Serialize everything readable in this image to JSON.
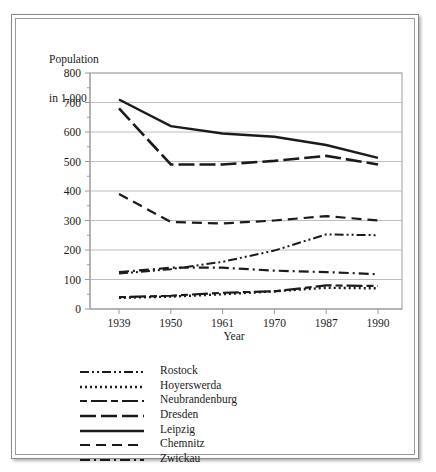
{
  "figure": {
    "axis_title_line1": "Population",
    "axis_title_line2": "in 1,000"
  },
  "chart_data": {
    "type": "line",
    "title": "",
    "subtitle": "",
    "xlabel": "Year",
    "ylabel": "Population in 1,000",
    "categories": [
      "1939",
      "1950",
      "1961",
      "1970",
      "1987",
      "1990"
    ],
    "x_tick_labels": [
      "1939",
      "1950",
      "1961",
      "1970",
      "1987",
      "1990"
    ],
    "y_tick_labels": [
      "0",
      "100",
      "200",
      "300",
      "400",
      "500",
      "600",
      "700",
      "800"
    ],
    "y_ticks": [
      0,
      100,
      200,
      300,
      400,
      500,
      600,
      700,
      800
    ],
    "y_minor_step": 50,
    "ylim": [
      0,
      800
    ],
    "grid": "horizontal",
    "legend_position": "below",
    "series": [
      {
        "name": "Rostock",
        "dash": "dash-dot-dot",
        "dasharray": "9,3,2,3,2,3",
        "width": 2.0,
        "values": [
          120,
          135,
          160,
          198,
          253,
          250
        ]
      },
      {
        "name": "Hoyerswerda",
        "dash": "dotted",
        "dasharray": "2,3",
        "width": 2.4,
        "values": [
          38,
          42,
          50,
          60,
          72,
          70
        ]
      },
      {
        "name": "Neubrandenburg",
        "dash": "dash-long",
        "dasharray": "7,4,16,4",
        "width": 2.2,
        "values": [
          40,
          45,
          55,
          60,
          80,
          78
        ]
      },
      {
        "name": "Dresden",
        "dash": "long-dash",
        "dasharray": "16,5",
        "width": 2.6,
        "values": [
          680,
          490,
          490,
          502,
          519,
          490
        ]
      },
      {
        "name": "Leipzig",
        "dash": "solid",
        "dasharray": "",
        "width": 2.4,
        "values": [
          710,
          620,
          595,
          584,
          556,
          512
        ]
      },
      {
        "name": "Chemnitz",
        "dash": "medium-dash",
        "dasharray": "10,6",
        "width": 2.2,
        "values": [
          390,
          295,
          290,
          300,
          315,
          300
        ]
      },
      {
        "name": "Zwickau",
        "dash": "dash-dot",
        "dasharray": "10,4,2,4",
        "width": 2.2,
        "values": [
          125,
          140,
          140,
          130,
          125,
          118
        ]
      }
    ]
  },
  "legend": {
    "entries": [
      {
        "label": "Rostock"
      },
      {
        "label": "Hoyerswerda"
      },
      {
        "label": "Neubrandenburg"
      },
      {
        "label": "Dresden"
      },
      {
        "label": "Leipzig"
      },
      {
        "label": "Chemnitz"
      },
      {
        "label": "Zwickau"
      }
    ]
  },
  "colors": {
    "line": "#1b1b1b",
    "grid": "#bdbdbd",
    "axis": "#9a9a9a",
    "text": "#1b1b1b",
    "frame": "#8a8a8a"
  }
}
